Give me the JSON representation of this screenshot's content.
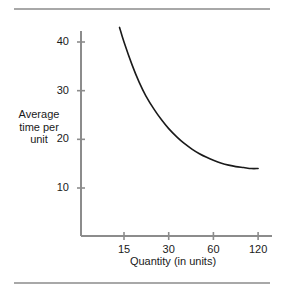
{
  "figure": {
    "background_color": "#ffffff",
    "rule_color": "#a8a8a8",
    "axis_color": "#8c8c8c",
    "curve_color": "#1a1a1a",
    "text_color": "#1a1a1a"
  },
  "chart_data": {
    "type": "line",
    "title": "",
    "subtitle": "",
    "xlabel": "Quantity (in units)",
    "ylabel": "Average time per unit",
    "ylabel_lines": [
      "Average",
      "time per",
      "unit"
    ],
    "xscale": "log2",
    "yscale": "linear",
    "grid": false,
    "legend": null,
    "xticks": [
      15,
      30,
      60,
      120
    ],
    "xtick_labels": [
      "15",
      "30",
      "60",
      "120"
    ],
    "yticks": [
      10,
      20,
      30,
      40
    ],
    "ytick_labels": [
      "10",
      "20",
      "30",
      "40"
    ],
    "xlim": [
      10.2,
      135
    ],
    "ylim": [
      0,
      45.5
    ],
    "series": [
      {
        "name": "Learning curve",
        "x": [
          14,
          15,
          17,
          19,
          21,
          24,
          27,
          30,
          34,
          38,
          43,
          48,
          54,
          60,
          68,
          76,
          85,
          96,
          108,
          120
        ],
        "y": [
          43.0,
          40.0,
          35.3,
          31.7,
          29.0,
          26.1,
          23.9,
          22.2,
          20.5,
          19.2,
          18.0,
          17.1,
          16.3,
          15.7,
          15.1,
          14.7,
          14.4,
          14.2,
          14.0,
          14.0
        ]
      }
    ],
    "annotations": []
  }
}
